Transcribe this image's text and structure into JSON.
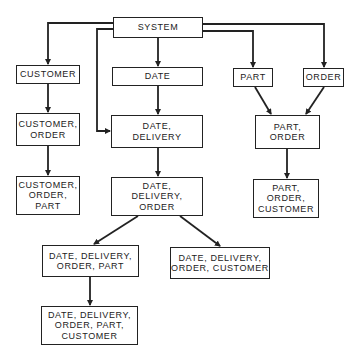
{
  "diagram": {
    "nodes": [
      {
        "id": "system",
        "label": "SYSTEM",
        "x": 113,
        "y": 17,
        "w": 90,
        "h": 21
      },
      {
        "id": "customer",
        "label": "CUSTOMER",
        "x": 16,
        "y": 65,
        "w": 64,
        "h": 19
      },
      {
        "id": "date",
        "label": "DATE",
        "x": 112,
        "y": 67,
        "w": 91,
        "h": 19
      },
      {
        "id": "part",
        "label": "PART",
        "x": 233,
        "y": 68,
        "w": 40,
        "h": 19
      },
      {
        "id": "order",
        "label": "ORDER",
        "x": 303,
        "y": 68,
        "w": 41,
        "h": 19
      },
      {
        "id": "customer_order",
        "label": "CUSTOMER,\nORDER",
        "x": 16,
        "y": 113,
        "w": 64,
        "h": 33
      },
      {
        "id": "date_delivery",
        "label": "DATE,\nDELIVERY",
        "x": 111,
        "y": 115,
        "w": 92,
        "h": 33
      },
      {
        "id": "part_order",
        "label": "PART,\nORDER",
        "x": 255,
        "y": 115,
        "w": 65,
        "h": 34
      },
      {
        "id": "customer_order_part",
        "label": "CUSTOMER,\nORDER,\nPART",
        "x": 16,
        "y": 176,
        "w": 64,
        "h": 39
      },
      {
        "id": "date_delivery_order",
        "label": "DATE,\nDELIVERY,\nORDER",
        "x": 111,
        "y": 177,
        "w": 92,
        "h": 39
      },
      {
        "id": "part_order_customer",
        "label": "PART,\nORDER,\nCUSTOMER",
        "x": 253,
        "y": 179,
        "w": 66,
        "h": 39
      },
      {
        "id": "ddo_part",
        "label": "DATE, DELIVERY,\nORDER, PART",
        "x": 42,
        "y": 245,
        "w": 97,
        "h": 32
      },
      {
        "id": "ddo_customer",
        "label": "DATE, DELIVERY,\nORDER, CUSTOMER",
        "x": 170,
        "y": 247,
        "w": 100,
        "h": 32
      },
      {
        "id": "ddo_part_customer",
        "label": "DATE, DELIVERY,\nORDER, PART,\nCUSTOMER",
        "x": 41,
        "y": 306,
        "w": 97,
        "h": 39
      }
    ],
    "edges": [
      {
        "from": "system",
        "to": "customer",
        "path": "M113,23 L48,23 L48,64"
      },
      {
        "from": "system",
        "to": "date",
        "path": "M158,38 L158,66"
      },
      {
        "from": "system",
        "to": "date_delivery",
        "path": "M113,29 L97,29 L97,131 L110,131"
      },
      {
        "from": "system",
        "to": "part",
        "path": "M203,31 L253,31 L253,67"
      },
      {
        "from": "system",
        "to": "order",
        "path": "M203,24 L324,24 L324,67"
      },
      {
        "from": "customer",
        "to": "customer_order",
        "path": "M48,84 L48,112"
      },
      {
        "from": "date",
        "to": "date_delivery",
        "path": "M158,86 L158,114"
      },
      {
        "from": "part",
        "to": "part_order",
        "path": "M255,87 L271,114"
      },
      {
        "from": "order",
        "to": "part_order",
        "path": "M324,87 L306,114"
      },
      {
        "from": "customer_order",
        "to": "customer_order_part",
        "path": "M48,146 L48,175"
      },
      {
        "from": "date_delivery",
        "to": "date_delivery_order",
        "path": "M158,148 L158,176"
      },
      {
        "from": "part_order",
        "to": "part_order_customer",
        "path": "M287,149 L287,178"
      },
      {
        "from": "date_delivery_order",
        "to": "ddo_part",
        "path": "M138,216 L94,244"
      },
      {
        "from": "date_delivery_order",
        "to": "ddo_customer",
        "path": "M180,216 L220,246"
      },
      {
        "from": "ddo_part",
        "to": "ddo_part_customer",
        "path": "M90,277 L90,305"
      }
    ],
    "colors": {
      "line": "#222222",
      "node_fill": "#ffffff",
      "background": "#ffffff"
    }
  }
}
